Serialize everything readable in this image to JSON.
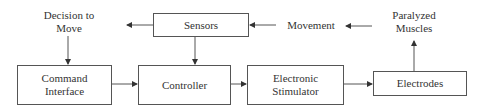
{
  "diagram": {
    "type": "block-diagram",
    "nodes": {
      "sensors": {
        "label": "Sensors"
      },
      "command_interface": {
        "label_line1": "Command",
        "label_line2": "Interface"
      },
      "controller": {
        "label": "Controller"
      },
      "electronic_stimulator": {
        "label_line1": "Electronic",
        "label_line2": "Stimulator"
      },
      "electrodes": {
        "label": "Electrodes"
      }
    },
    "labels": {
      "decision_to_move": {
        "line1": "Decision to",
        "line2": "Move"
      },
      "movement": {
        "text": "Movement"
      },
      "paralyzed_muscles": {
        "line1": "Paralyzed",
        "line2": "Muscles"
      }
    },
    "edges": [
      {
        "from": "Decision to Move",
        "to": "Command Interface"
      },
      {
        "from": "Command Interface",
        "to": "Controller"
      },
      {
        "from": "Controller",
        "to": "Electronic Stimulator"
      },
      {
        "from": "Electronic Stimulator",
        "to": "Electrodes"
      },
      {
        "from": "Electrodes",
        "to": "Paralyzed Muscles"
      },
      {
        "from": "Paralyzed Muscles",
        "to": "Movement"
      },
      {
        "from": "Movement",
        "to": "Sensors"
      },
      {
        "from": "Sensors",
        "to": "Controller"
      },
      {
        "from": "Sensors",
        "to": "Decision to Move"
      }
    ]
  }
}
